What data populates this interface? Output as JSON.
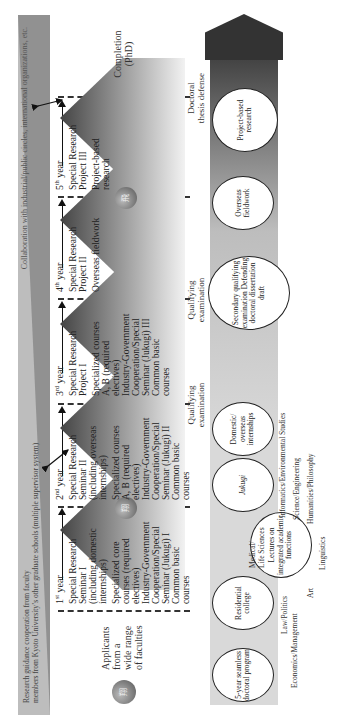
{
  "collaboration_bar": {
    "top_text": "Collaboration with industrial/public circles, international organizations, etc.",
    "bottom_text_line1": "Research guidance cooperation from faculty",
    "bottom_text_line2": "members from Kyoto University’s other graduate schools (multiple supervisor system)"
  },
  "applicants": {
    "label_line1": "Applicants",
    "label_line2": "from a",
    "label_line3": "wide range",
    "label_line4": "of faculties",
    "seal_glyph": "翔"
  },
  "years": [
    {
      "label": "1",
      "suffix": "st",
      "word": "year",
      "lines": [
        "Special Research",
        "Seminar I",
        "(including domestic",
        "internships)",
        "Specialized core",
        "courses (required",
        "electives)",
        "Industry-Government",
        "Cooperation/Special",
        "Seminar (Jukugi) I",
        "Common basic",
        "courses"
      ],
      "seal_glyph": "翔"
    },
    {
      "label": "2",
      "suffix": "nd",
      "word": "year",
      "lines": [
        "Special Research",
        "Seminar II",
        "(including overseas",
        "internships)",
        "Specialized courses",
        "A, B (required",
        "electives)",
        "Industry-Government",
        "Cooperation/Special",
        "Seminar (Jukugi) II",
        "Common basic",
        "courses"
      ]
    },
    {
      "label": "3",
      "suffix": "rd",
      "word": "year",
      "lines": [
        "Special Research",
        "Project I",
        "Specialized courses",
        "A, B (required",
        "electives)",
        "Industry-Government",
        "Cooperation/Special",
        "Seminar (Jukugi) III",
        "Common basic",
        "courses"
      ]
    },
    {
      "label": "4",
      "suffix": "th",
      "word": "year",
      "lines": [
        "Special Research",
        "Project II",
        "Overseas fieldwork"
      ]
    },
    {
      "label": "5",
      "suffix": "th",
      "word": "year",
      "lines": [
        "Special Research",
        "Project III",
        "Project-based",
        "research"
      ],
      "seal_glyph": "飛"
    }
  ],
  "milestones": {
    "qualifying_1": [
      "Qualifying",
      "examination"
    ],
    "qualifying_2": [
      "Qualifying",
      "examination"
    ],
    "defense": [
      "Doctoral",
      "thesis defense"
    ],
    "completion": [
      "Completion",
      "(PhD)"
    ]
  },
  "features": [
    {
      "text": "5-year seamless doctoral program"
    },
    {
      "text": "Residential college"
    },
    {
      "text": "Lectures on integrated academic functions"
    },
    {
      "text": "Jukugi"
    },
    {
      "text": "Domestic/ overseas internships"
    },
    {
      "text": "Secondary qualifying examination Defending doctoral dissertation draft"
    },
    {
      "text": "Overseas fieldwork"
    },
    {
      "text": "Project-based research"
    }
  ],
  "fields": {
    "economics": "Economics/Management",
    "law": "Law/Politics",
    "art": "Art",
    "medical": "Medical/",
    "life": "Life Sciences",
    "linguistics": "Linguistics",
    "informatics": "Informatics/Environmental Studies",
    "science": "Science/Engineering",
    "humanities": "Humanities/Philosophy"
  }
}
